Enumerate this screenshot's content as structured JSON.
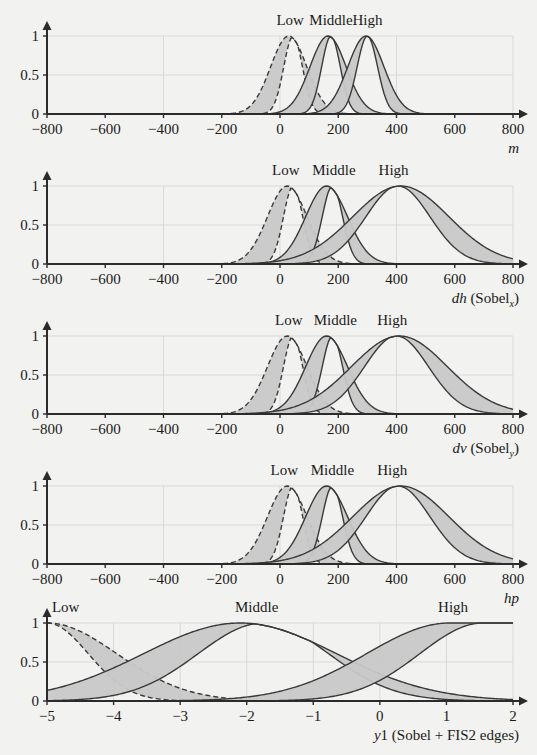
{
  "figure": {
    "background": "#f2f2f0",
    "line_color": "#3a3a3a",
    "fill_color": "#c8c8c8",
    "grid_color": "#d9d9d9"
  },
  "chart_data": [
    {
      "type": "area",
      "index": 0,
      "title": "",
      "xlabel": "m",
      "xlabel_parts": {
        "italic": "m",
        "upright": "",
        "sub": ""
      },
      "ylabel": "",
      "xlim": [
        -800,
        800
      ],
      "ylim": [
        0,
        1
      ],
      "xticks": [
        -800,
        -600,
        -400,
        -200,
        0,
        200,
        400,
        600,
        800
      ],
      "xticklabels": [
        "−800",
        "−600",
        "−400",
        "−200",
        "0",
        "200",
        "400",
        "600",
        "800"
      ],
      "yticks": [
        0,
        0.5,
        1
      ],
      "yticklabels": [
        "0",
        "0.5",
        "1"
      ],
      "xgrid": [
        -400,
        0,
        400
      ],
      "ygrid": [
        0.5
      ],
      "grid": true,
      "legend_position": "above-plot",
      "series": [
        {
          "name": "Low",
          "style": "dashed",
          "peak": 1.0,
          "upper": {
            "center": 30,
            "sigma": 62
          },
          "lower": {
            "center": 45,
            "sigma": 32
          },
          "label_x": 35,
          "label_y": 1.0
        },
        {
          "name": "Middle",
          "style": "solid",
          "peak": 1.0,
          "upper": {
            "center": 165,
            "sigma": 62
          },
          "lower": {
            "center": 175,
            "sigma": 32
          },
          "label_x": 175,
          "label_y": 1.0
        },
        {
          "name": "High",
          "style": "solid",
          "peak": 1.0,
          "upper": {
            "center": 295,
            "sigma": 62
          },
          "lower": {
            "center": 300,
            "sigma": 35
          },
          "label_x": 300,
          "label_y": 1.0
        }
      ]
    },
    {
      "type": "area",
      "index": 1,
      "title": "",
      "xlabel": "dh (Sobel_x)",
      "xlabel_parts": {
        "italic": "dh",
        "upright": " (Sobel",
        "sub": "x",
        "close": ")"
      },
      "ylabel": "",
      "xlim": [
        -800,
        800
      ],
      "ylim": [
        0,
        1
      ],
      "xticks": [
        -800,
        -600,
        -400,
        -200,
        0,
        200,
        400,
        600,
        800
      ],
      "xticklabels": [
        "−800",
        "−600",
        "−400",
        "−200",
        "0",
        "200",
        "400",
        "600",
        "800"
      ],
      "yticks": [
        0,
        0.5,
        1
      ],
      "yticklabels": [
        "0",
        "0.5",
        "1"
      ],
      "xgrid": [
        -400,
        0,
        400
      ],
      "ygrid": [
        0.5
      ],
      "grid": true,
      "legend_position": "above-plot",
      "series": [
        {
          "name": "Low",
          "style": "dashed",
          "peak": 1.0,
          "upper": {
            "center": 25,
            "sigma": 68
          },
          "lower": {
            "center": 45,
            "sigma": 33
          },
          "label_x": 20,
          "label_y": 1.0
        },
        {
          "name": "Middle",
          "style": "solid",
          "peak": 1.0,
          "upper": {
            "center": 160,
            "sigma": 72
          },
          "lower": {
            "center": 180,
            "sigma": 35
          },
          "label_x": 185,
          "label_y": 1.0
        },
        {
          "name": "High",
          "style": "solid",
          "peak": 1.0,
          "upper": {
            "center": 415,
            "sigma": 165
          },
          "lower": {
            "center": 405,
            "sigma": 110
          },
          "label_x": 390,
          "label_y": 1.0
        }
      ]
    },
    {
      "type": "area",
      "index": 2,
      "title": "",
      "xlabel": "dv (Sobel_y)",
      "xlabel_parts": {
        "italic": "dv",
        "upright": " (Sobel",
        "sub": "y",
        "close": ")"
      },
      "ylabel": "",
      "xlim": [
        -800,
        800
      ],
      "ylim": [
        0,
        1
      ],
      "xticks": [
        -800,
        -600,
        -400,
        -200,
        0,
        200,
        400,
        600,
        800
      ],
      "xticklabels": [
        "−800",
        "−600",
        "−400",
        "−200",
        "0",
        "200",
        "400",
        "600",
        "800"
      ],
      "yticks": [
        0,
        0.5,
        1
      ],
      "yticklabels": [
        "0",
        "0.5",
        "1"
      ],
      "xgrid": [
        -400,
        0,
        400
      ],
      "ygrid": [
        0.5
      ],
      "grid": true,
      "legend_position": "above-plot",
      "series": [
        {
          "name": "Low",
          "style": "dashed",
          "peak": 1.0,
          "upper": {
            "center": 25,
            "sigma": 68
          },
          "lower": {
            "center": 45,
            "sigma": 33
          },
          "label_x": 30,
          "label_y": 1.0
        },
        {
          "name": "Middle",
          "style": "solid",
          "peak": 1.0,
          "upper": {
            "center": 160,
            "sigma": 72
          },
          "lower": {
            "center": 180,
            "sigma": 35
          },
          "label_x": 190,
          "label_y": 1.0
        },
        {
          "name": "High",
          "style": "solid",
          "peak": 1.0,
          "upper": {
            "center": 410,
            "sigma": 165
          },
          "lower": {
            "center": 400,
            "sigma": 110
          },
          "label_x": 385,
          "label_y": 1.0
        }
      ]
    },
    {
      "type": "area",
      "index": 3,
      "title": "",
      "xlabel": "hp",
      "xlabel_parts": {
        "italic": "hp",
        "upright": "",
        "sub": ""
      },
      "ylabel": "",
      "xlim": [
        -800,
        800
      ],
      "ylim": [
        0,
        1
      ],
      "xticks": [
        -800,
        -600,
        -400,
        -200,
        0,
        200,
        400,
        600,
        800
      ],
      "xticklabels": [
        "−800",
        "−600",
        "−400",
        "−200",
        "0",
        "200",
        "400",
        "600",
        "800"
      ],
      "yticks": [
        0,
        0.5,
        1
      ],
      "yticklabels": [
        "0",
        "0.5",
        "1"
      ],
      "xgrid": [
        -400,
        0,
        400
      ],
      "ygrid": [
        0.5
      ],
      "grid": true,
      "legend_position": "above-plot",
      "series": [
        {
          "name": "Low",
          "style": "dashed",
          "peak": 1.0,
          "upper": {
            "center": 25,
            "sigma": 68
          },
          "lower": {
            "center": 45,
            "sigma": 33
          },
          "label_x": 15,
          "label_y": 1.0
        },
        {
          "name": "Middle",
          "style": "solid",
          "peak": 1.0,
          "upper": {
            "center": 160,
            "sigma": 72
          },
          "lower": {
            "center": 180,
            "sigma": 35
          },
          "label_x": 180,
          "label_y": 1.0
        },
        {
          "name": "High",
          "style": "solid",
          "peak": 1.0,
          "upper": {
            "center": 415,
            "sigma": 165
          },
          "lower": {
            "center": 405,
            "sigma": 110
          },
          "label_x": 385,
          "label_y": 1.0
        }
      ]
    },
    {
      "type": "area",
      "index": 4,
      "title": "",
      "xlabel": "y1 (Sobel + FIS2 edges)",
      "xlabel_parts": {
        "italic": "y",
        "upright": "1 (Sobel + FIS2 edges)",
        "sub": ""
      },
      "ylabel": "",
      "xlim": [
        -5,
        2
      ],
      "ylim": [
        0,
        1
      ],
      "xticks": [
        -5,
        -4,
        -3,
        -2,
        -1,
        0,
        1,
        2
      ],
      "xticklabels": [
        "−5",
        "−4",
        "−3",
        "−2",
        "−1",
        "0",
        "1",
        "2"
      ],
      "yticks": [
        0,
        0.5,
        1
      ],
      "yticklabels": [
        "0",
        "0.5",
        "1"
      ],
      "xgrid": [
        -4,
        -3,
        -2,
        -1,
        0,
        1
      ],
      "ygrid": [
        0.5
      ],
      "grid": true,
      "legend_position": "above-plot",
      "series": [
        {
          "name": "Low",
          "style": "dashed",
          "peak": 1.0,
          "shape": "shoulder-left",
          "upper": {
            "center": -5.0,
            "sigma": 1.05
          },
          "lower": {
            "center": -5.0,
            "sigma": 0.62
          },
          "label_x": -4.72,
          "label_y": 1.0
        },
        {
          "name": "Middle",
          "style": "solid",
          "peak": 1.0,
          "shape": "gauss",
          "upper": {
            "center": -2.1,
            "sigma": 1.45
          },
          "lower": {
            "center": -1.75,
            "sigma": 0.98
          },
          "label_x": -1.85,
          "label_y": 1.0
        },
        {
          "name": "High",
          "style": "solid",
          "peak": 1.0,
          "shape": "shoulder-right",
          "upper": {
            "center": 1.05,
            "sigma": 1.25
          },
          "lower": {
            "center": 1.55,
            "sigma": 0.95
          },
          "label_x": 1.1,
          "label_y": 1.0
        }
      ]
    }
  ]
}
